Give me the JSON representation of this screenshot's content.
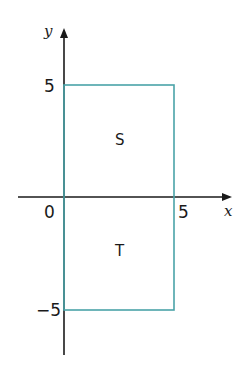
{
  "axes": {
    "x_label": "x",
    "y_label": "y",
    "x_ticks": [
      "0",
      "5"
    ],
    "y_ticks": [
      "5",
      "−5"
    ]
  },
  "rectangle": {
    "x_range": [
      0,
      5
    ],
    "y_range": [
      -5,
      5
    ],
    "color": "#4aa3a8"
  },
  "regions": [
    {
      "label": "S",
      "position": "upper half"
    },
    {
      "label": "T",
      "position": "lower half"
    }
  ]
}
